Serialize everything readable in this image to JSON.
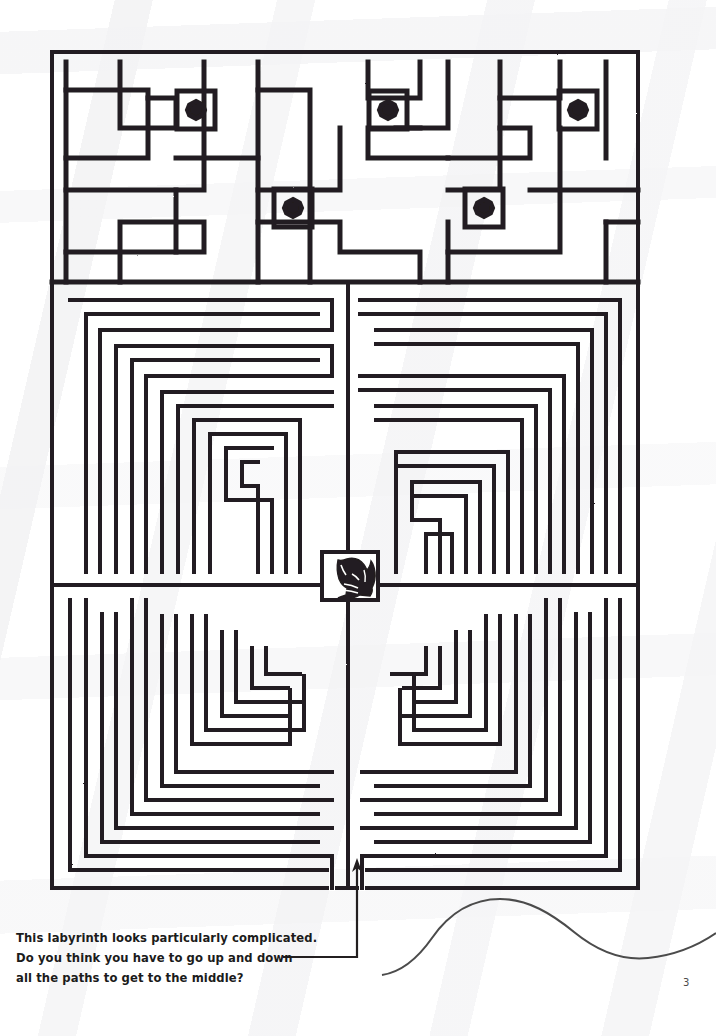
{
  "page": {
    "number": "3",
    "background_color": "#ffffff",
    "ink_color": "#231f20"
  },
  "caption": {
    "line1": "This labyrinth looks particularly complicated.",
    "line2": "Do you think you have to go up and down",
    "line3": "all the paths to get to the middle?"
  },
  "puzzle": {
    "type": "labyrinth-maze",
    "title_visible": false,
    "border": {
      "x": 52,
      "y": 52,
      "width": 586,
      "height": 836
    },
    "meander_band": {
      "name": "greek-key-border-band",
      "y_top": 52,
      "y_bottom": 282,
      "dot_squares_row1": [
        {
          "cx": 196,
          "cy": 110
        },
        {
          "cx": 388,
          "cy": 110
        },
        {
          "cx": 578,
          "cy": 110
        }
      ],
      "dot_squares_row2": [
        {
          "cx": 104,
          "cy": 208
        },
        {
          "cx": 293,
          "cy": 208
        },
        {
          "cx": 484,
          "cy": 208
        }
      ]
    },
    "center_goal": {
      "name": "center-rabbit-figure",
      "x": 322,
      "y": 552,
      "width": 56,
      "height": 48
    },
    "entrance": {
      "x": 357,
      "y": 888,
      "label": "bottom-entrance"
    },
    "leader_line": {
      "from_x": 283,
      "from_y": 957,
      "corner_x": 357,
      "corner_y": 957,
      "to_x": 357,
      "to_y": 862
    },
    "decor_curve": {
      "name": "bottom-wave-rule",
      "y_center": 945
    }
  }
}
